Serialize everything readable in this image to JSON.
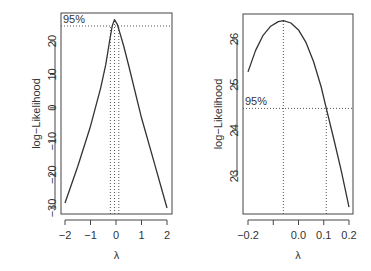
{
  "chart_data": [
    {
      "type": "line",
      "title": "",
      "xlabel": "λ",
      "ylabel": "log−Likelihood",
      "xlim": [
        -2.1,
        2.1
      ],
      "ylim": [
        -31,
        27
      ],
      "xticks": [
        "-2",
        "-1",
        "0",
        "1",
        "2"
      ],
      "xtick_values": [
        -2,
        -1,
        0,
        1,
        2
      ],
      "yticks": [
        "-30",
        "-20",
        "-10",
        "0",
        "10",
        "20"
      ],
      "ytick_values": [
        -30,
        -20,
        -10,
        0,
        10,
        20
      ],
      "grid": false,
      "annotation": "95%",
      "ci_level_y": 24.5,
      "mle_lambda": -0.06,
      "ci_lambda": [
        -0.22,
        0.11
      ],
      "series": [
        {
          "name": "log-Likelihood",
          "x": [
            -2.0,
            -1.5,
            -1.0,
            -0.6,
            -0.4,
            -0.25,
            -0.15,
            -0.06,
            0.05,
            0.15,
            0.3,
            0.5,
            1.0,
            1.5,
            2.0
          ],
          "y": [
            -28.5,
            -17.5,
            -5.5,
            6.0,
            13.0,
            20.0,
            24.5,
            26.4,
            25.0,
            22.5,
            18.5,
            12.5,
            -3.0,
            -16.5,
            -30.0
          ]
        }
      ]
    },
    {
      "type": "line",
      "title": "",
      "xlabel": "λ",
      "ylabel": "log−Likelihood",
      "xlim": [
        -0.21,
        0.21
      ],
      "ylim": [
        22.2,
        26.5
      ],
      "xticks": [
        "-0.2",
        "",
        "0.0",
        "0.1",
        "0.2"
      ],
      "xtick_values": [
        -0.2,
        -0.1,
        0.0,
        0.1,
        0.2
      ],
      "yticks": [
        "23",
        "24",
        "25",
        "26"
      ],
      "ytick_values": [
        23,
        24,
        25,
        26
      ],
      "grid": false,
      "annotation": "95%",
      "ci_level_y": 24.48,
      "mle_lambda": -0.06,
      "ci_lambda": [
        null,
        0.11
      ],
      "series": [
        {
          "name": "log-Likelihood",
          "x": [
            -0.2,
            -0.17,
            -0.14,
            -0.11,
            -0.08,
            -0.06,
            -0.03,
            0.0,
            0.03,
            0.06,
            0.09,
            0.11,
            0.14,
            0.17,
            0.2
          ],
          "y": [
            25.28,
            25.75,
            26.08,
            26.28,
            26.38,
            26.4,
            26.35,
            26.2,
            25.92,
            25.5,
            24.95,
            24.48,
            23.8,
            23.1,
            22.32
          ]
        }
      ]
    }
  ]
}
